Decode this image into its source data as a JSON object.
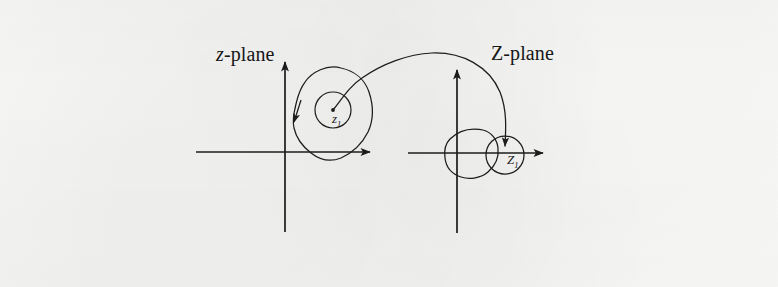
{
  "figure": {
    "background_color": "#fdfdfc",
    "ink_color": "#1a1a1a",
    "width": 778,
    "height": 287
  },
  "labels": {
    "z_plane": {
      "variable": "z",
      "suffix": "-plane",
      "full": "z-plane"
    },
    "Z_plane": {
      "variable": "Z",
      "suffix": "-plane",
      "full": "Z-plane"
    },
    "z1_point": {
      "variable": "z",
      "subscript": "1",
      "full": "z1"
    },
    "Z1_point": {
      "variable": "Z",
      "subscript": "1",
      "full": "Z1"
    }
  },
  "chart_data": {
    "type": "diagram",
    "grid": false,
    "legend": null,
    "panels": [
      {
        "name": "z-plane",
        "label": "z-plane",
        "label_position": {
          "x": 216,
          "y": 44
        },
        "axes": {
          "origin": {
            "x": 285,
            "y": 152
          },
          "x_axis": {
            "x_start": 196,
            "x_end": 373,
            "y": 152,
            "arrow_at": "end"
          },
          "y_axis": {
            "y_start": 232,
            "y_end": 58,
            "x": 285,
            "arrow_at": "top"
          }
        },
        "curves": [
          {
            "name": "outer-contour",
            "kind": "closed-irregular-blob",
            "description": "large closed irregular contour enclosing the point z1",
            "direction_marker": {
              "x": 295,
              "y": 113,
              "heading": "down-left"
            },
            "approx_extent": {
              "left": 296,
              "right": 372,
              "top": 67,
              "bottom": 160
            }
          },
          {
            "name": "inner-circle",
            "kind": "circle",
            "center": {
              "x": 333,
              "y": 110
            },
            "radius": 18
          }
        ],
        "points": [
          {
            "name": "z1",
            "label": "z1",
            "x": 333,
            "y": 110
          }
        ]
      },
      {
        "name": "Z-plane",
        "label": "Z-plane",
        "label_position": {
          "x": 491,
          "y": 43
        },
        "axes": {
          "origin": {
            "x": 457,
            "y": 153
          },
          "x_axis": {
            "x_start": 408,
            "x_end": 546,
            "y": 153,
            "arrow_at": "end"
          },
          "y_axis": {
            "y_start": 233,
            "y_end": 66,
            "x": 457,
            "arrow_at": "top"
          }
        },
        "curves": [
          {
            "name": "image-contour",
            "kind": "closed-irregular-blob",
            "description": "image of the outer contour under the mapping, small rounded polygon",
            "approx_extent": {
              "left": 444,
              "right": 500,
              "top": 128,
              "bottom": 178
            }
          },
          {
            "name": "image-circle",
            "kind": "circle",
            "center": {
              "x": 505,
              "y": 155
            },
            "radius": 19
          }
        ],
        "points": [
          {
            "name": "Z1",
            "label": "Z1",
            "x": 505,
            "y": 155
          }
        ]
      }
    ],
    "connector": {
      "name": "mapping-arc",
      "kind": "arc",
      "from": {
        "panel": "z-plane",
        "point": "z1",
        "x": 333,
        "y": 110
      },
      "to": {
        "panel": "Z-plane",
        "point": "Z1",
        "x": 505,
        "y": 152
      },
      "arrow_at": "end",
      "description": "large arc from z1 sweeping up and over to Z1, indicating the conformal map"
    }
  }
}
